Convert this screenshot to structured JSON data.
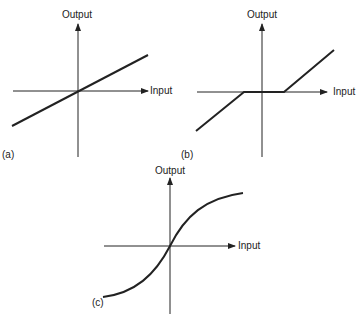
{
  "figure": {
    "panels": [
      {
        "id": "a",
        "label": "(a)",
        "y_axis_label": "Output",
        "x_axis_label": "Input",
        "curve": "linear"
      },
      {
        "id": "b",
        "label": "(b)",
        "y_axis_label": "Output",
        "x_axis_label": "Input",
        "curve": "dead-zone"
      },
      {
        "id": "c",
        "label": "(c)",
        "y_axis_label": "Output",
        "x_axis_label": "Input",
        "curve": "saturation"
      }
    ],
    "colors": {
      "ink": "#222222",
      "background": "#ffffff"
    }
  }
}
